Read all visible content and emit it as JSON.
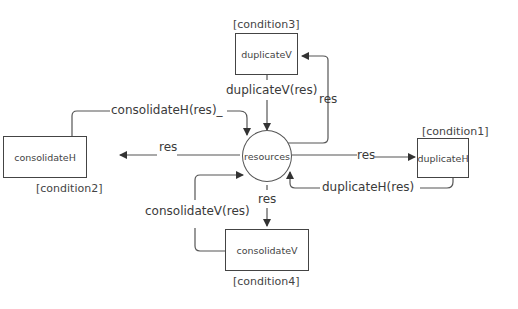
{
  "diagram": {
    "center": {
      "label": "resources"
    },
    "nodes": [
      {
        "id": "duplicateV",
        "label": "duplicateV",
        "condition": "[condition3]"
      },
      {
        "id": "consolidateH",
        "label": "consolidateH",
        "condition": "[condition2]"
      },
      {
        "id": "duplicateH",
        "label": "duplicateH",
        "condition": "[condition1]"
      },
      {
        "id": "consolidateV",
        "label": "consolidateV",
        "condition": "[condition4]"
      }
    ],
    "edges": [
      {
        "from": "duplicateV",
        "to": "resources",
        "label": "duplicateV(res)"
      },
      {
        "from": "resources",
        "to": "duplicateV",
        "label": "res"
      },
      {
        "from": "consolidateH",
        "to": "resources",
        "label": "consolidateH(res)_"
      },
      {
        "from": "resources",
        "to": "consolidateH",
        "label": "res"
      },
      {
        "from": "resources",
        "to": "duplicateH",
        "label": "res"
      },
      {
        "from": "duplicateH",
        "to": "resources",
        "label": "duplicateH(res)"
      },
      {
        "from": "consolidateV",
        "to": "resources",
        "label": "consolidateV(res)"
      },
      {
        "from": "resources",
        "to": "consolidateV",
        "label": "res"
      }
    ]
  }
}
